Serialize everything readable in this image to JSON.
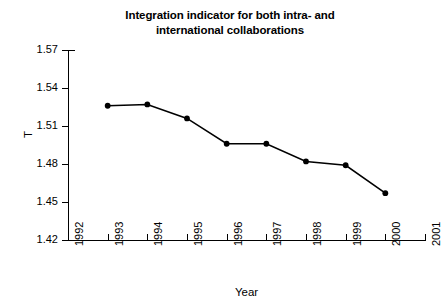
{
  "chart_data": {
    "type": "line",
    "title": "Integration indicator for both intra- and international collaborations",
    "title_lines": [
      "Integration indicator for both intra- and",
      "international collaborations"
    ],
    "xlabel": "Year",
    "ylabel": "T",
    "x": [
      1993,
      1994,
      1995,
      1996,
      1997,
      1998,
      1999,
      2000
    ],
    "values": [
      1.526,
      1.527,
      1.516,
      1.496,
      1.496,
      1.482,
      1.479,
      1.457
    ],
    "xlim": [
      1992,
      2001
    ],
    "ylim": [
      1.42,
      1.57
    ],
    "xticks": [
      1992,
      1993,
      1994,
      1995,
      1996,
      1997,
      1998,
      1999,
      2000,
      2001
    ],
    "xtick_labels": [
      "1992",
      "1993",
      "1994",
      "1995",
      "1996",
      "1997",
      "1998",
      "1999",
      "2000",
      "2001"
    ],
    "yticks": [
      1.42,
      1.45,
      1.48,
      1.51,
      1.54,
      1.57
    ],
    "ytick_labels": [
      "1.42",
      "1.45",
      "1.48",
      "1.51",
      "1.54",
      "1.57"
    ],
    "grid": false,
    "legend": false,
    "marker": "filled-circle",
    "line_color": "#000000",
    "marker_color": "#000000",
    "background_color": "#ffffff"
  }
}
